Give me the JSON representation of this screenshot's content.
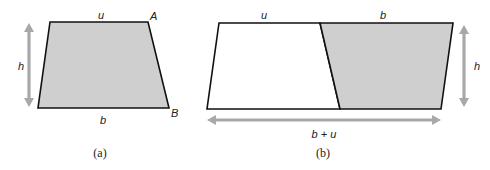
{
  "figure_a": {
    "caption": "(a)",
    "labels": {
      "top": "u",
      "bottom": "b",
      "height": "h",
      "vertex_top_right": "A",
      "vertex_bottom_right": "B"
    },
    "shape": "trapezoid",
    "fill_color": "#cfcfcf"
  },
  "figure_b": {
    "caption": "(b)",
    "labels": {
      "top_left": "u",
      "top_right": "b",
      "height": "h",
      "bottom_total": "b + u"
    },
    "shape": "parallelogram composed of two trapezoids",
    "left_fill_color": "#ffffff",
    "right_fill_color": "#cfcfcf",
    "arrow_color": "#a8a8a8"
  }
}
